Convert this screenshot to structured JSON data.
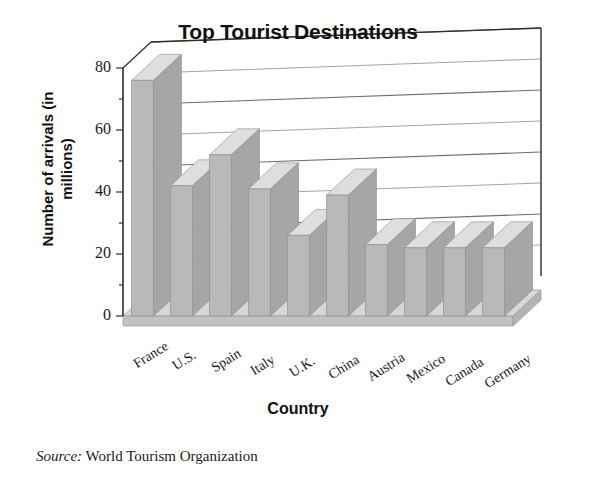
{
  "chart_data": {
    "type": "bar",
    "title": "Top Tourist Destinations",
    "xlabel": "Country",
    "ylabel": "Number of arrivals (in millions)",
    "categories": [
      "France",
      "U.S.",
      "Spain",
      "Italy",
      "U.K.",
      "China",
      "Austria",
      "Mexico",
      "Canada",
      "Germany"
    ],
    "values": [
      76,
      42,
      52,
      41,
      26,
      39,
      23,
      22,
      22,
      22
    ],
    "ylim": [
      0,
      80
    ],
    "yticks": [
      0,
      20,
      40,
      60,
      80
    ],
    "yticks_minor": [
      10,
      30,
      50,
      70
    ],
    "grid": true,
    "legend": false,
    "style": "3d-column",
    "series": [
      {
        "name": "Number of arrivals (in millions)",
        "values": [
          76,
          42,
          52,
          41,
          26,
          39,
          23,
          22,
          22,
          22
        ]
      }
    ]
  },
  "source": {
    "label": "Source:",
    "text": "World Tourism Organization"
  },
  "colors": {
    "bar_front": "#b9b9b9",
    "bar_top": "#dedede",
    "bar_side": "#a6a6a6",
    "floor_top": "#d7d7d7",
    "floor_front": "#c2c2c2",
    "axis": "#3a3a3a",
    "grid": "#8f8f8f",
    "text": "#111111",
    "background": "#ffffff"
  },
  "axis_labels": {
    "y": [
      "0",
      "20",
      "40",
      "60",
      "80"
    ]
  }
}
